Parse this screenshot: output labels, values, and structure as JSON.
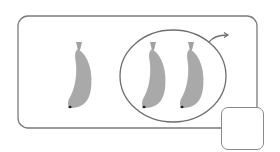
{
  "figure": {
    "total_bananas": 3,
    "circled_bananas": 2,
    "uncircled_bananas": 1,
    "answer_box_value": "",
    "colors": {
      "banana": "#a9a9a9",
      "banana_tip": "#222222",
      "outline": "#7a7a7a",
      "background": "#ffffff"
    }
  }
}
